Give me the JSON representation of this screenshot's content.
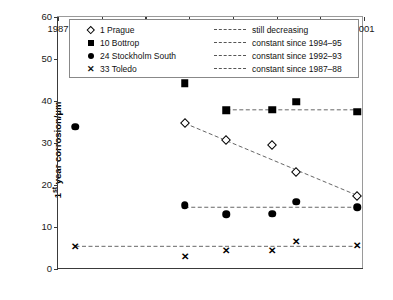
{
  "chart_data": {
    "type": "scatter",
    "title": "",
    "xlabel": "",
    "ylabel": "1st year corrosion/µm",
    "xlim": [
      1987,
      2001
    ],
    "ylim": [
      0,
      60
    ],
    "xticks": [
      1987,
      1989,
      1991,
      1993,
      1995,
      1997,
      1999,
      2001
    ],
    "yticks": [
      0,
      10,
      20,
      30,
      40,
      50,
      60
    ],
    "grid": false,
    "legend_position": "top-inside",
    "series": [
      {
        "name": "1 Prague",
        "marker": "open-diamond",
        "x": [
          1987.8,
          1992.8,
          1994.7,
          1996.8,
          1997.9,
          2000.7
        ],
        "values": [
          56.0,
          34.7,
          30.7,
          29.6,
          23.2,
          17.5
        ]
      },
      {
        "name": "10 Bottrop",
        "marker": "filled-square",
        "x": [
          1987.8,
          1992.8,
          1994.7,
          1996.8,
          1997.9,
          2000.7
        ],
        "values": [
          47.8,
          44.2,
          37.8,
          37.9,
          39.8,
          37.4
        ]
      },
      {
        "name": "24 Stockholm South",
        "marker": "filled-circle",
        "x": [
          1987.8,
          1992.8,
          1994.7,
          1996.8,
          1997.9,
          2000.7
        ],
        "values": [
          33.9,
          15.2,
          13.0,
          13.2,
          16.0,
          14.7
        ]
      },
      {
        "name": "33 Toledo",
        "marker": "cross",
        "x": [
          1987.8,
          1992.8,
          1994.7,
          1996.8,
          1997.9,
          2000.7
        ],
        "values": [
          5.5,
          3.2,
          4.5,
          4.5,
          6.7,
          5.7
        ]
      }
    ],
    "trend_lines": [
      {
        "name": "still decreasing",
        "series": "1 Prague",
        "style": "dashed",
        "x": [
          1992.8,
          2000.7
        ],
        "y": [
          34.7,
          17.5
        ]
      },
      {
        "name": "constant since 1994-95",
        "series": "10 Bottrop",
        "style": "dashed",
        "x": [
          1994.7,
          2000.7
        ],
        "y": [
          37.9,
          37.9
        ]
      },
      {
        "name": "constant since 1992-93",
        "series": "24 Stockholm South",
        "style": "dashed",
        "x": [
          1992.8,
          2000.7
        ],
        "y": [
          14.7,
          14.7
        ]
      },
      {
        "name": "constant since 1987-88",
        "series": "33 Toledo",
        "style": "dashed",
        "x": [
          1987.8,
          2000.7
        ],
        "y": [
          5.4,
          5.4
        ]
      }
    ]
  },
  "legend": {
    "series_entries": [
      {
        "symbol": "open-diamond",
        "label": "1 Prague"
      },
      {
        "symbol": "filled-square",
        "label": "10 Bottrop"
      },
      {
        "symbol": "filled-circle",
        "label": "24 Stockholm South"
      },
      {
        "symbol": "cross",
        "label": "33 Toledo"
      }
    ],
    "line_entries": [
      {
        "style": "dashed",
        "label": "still decreasing"
      },
      {
        "style": "dashed",
        "label": "constant since 1994–95"
      },
      {
        "style": "dashed",
        "label": "constant since 1992–93"
      },
      {
        "style": "dashed",
        "label": "constant since 1987–88"
      }
    ]
  },
  "axis": {
    "y_title_prefix": "1",
    "y_title_sup": "st",
    "y_title_suffix": " year corrosion/µm"
  },
  "colors": {
    "axis": "#3a3a3a",
    "marker": "#000000",
    "trend": "#555555",
    "background": "#ffffff"
  },
  "glyphs": {
    "cross": "✕"
  }
}
